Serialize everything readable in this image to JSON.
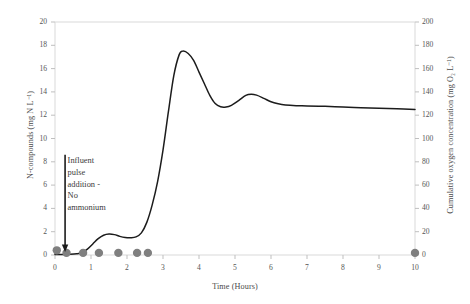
{
  "chart_data": {
    "type": "line",
    "title": "",
    "xlabel": "Time (Hours)",
    "ylabel": "N-compounds (mg N L⁻¹)",
    "ylabel_right": "Cumulative oxygen concentration (mg O₂ L⁻¹)",
    "xlim": [
      0,
      10
    ],
    "ylim": [
      0,
      20
    ],
    "ylim_right": [
      0,
      200
    ],
    "xticks": [
      0,
      1,
      2,
      3,
      4,
      5,
      6,
      7,
      8,
      9,
      10
    ],
    "yticks": [
      0,
      2,
      4,
      6,
      8,
      10,
      12,
      14,
      16,
      18,
      20
    ],
    "yticks_right": [
      0,
      20,
      40,
      60,
      80,
      100,
      120,
      140,
      160,
      180,
      200
    ],
    "grid": false,
    "legend": "none",
    "annotations": [
      {
        "text": "Influent\npulse\naddition -\nNo\nammonium",
        "x": 0.35,
        "y": 8.2,
        "arrow": "down-arrow",
        "arrow_x": 0.28,
        "arrow_from_y": 8.6,
        "arrow_to_y": 0.3
      }
    ],
    "series": [
      {
        "name": "Cumulative oxygen concentration",
        "type": "line",
        "color": "#1c1c1c",
        "axis": "right",
        "points": [
          [
            0.0,
            0.05
          ],
          [
            0.2,
            0.05
          ],
          [
            0.4,
            0.06
          ],
          [
            0.6,
            0.1
          ],
          [
            0.75,
            0.2
          ],
          [
            0.9,
            0.5
          ],
          [
            1.05,
            0.95
          ],
          [
            1.2,
            1.4
          ],
          [
            1.35,
            1.7
          ],
          [
            1.5,
            1.8
          ],
          [
            1.65,
            1.75
          ],
          [
            1.8,
            1.6
          ],
          [
            1.95,
            1.5
          ],
          [
            2.1,
            1.48
          ],
          [
            2.25,
            1.55
          ],
          [
            2.4,
            1.9
          ],
          [
            2.55,
            2.8
          ],
          [
            2.7,
            4.3
          ],
          [
            2.85,
            6.3
          ],
          [
            3.0,
            9.0
          ],
          [
            3.15,
            12.3
          ],
          [
            3.3,
            15.4
          ],
          [
            3.45,
            17.2
          ],
          [
            3.55,
            17.5
          ],
          [
            3.7,
            17.3
          ],
          [
            3.85,
            16.7
          ],
          [
            4.0,
            15.7
          ],
          [
            4.15,
            14.7
          ],
          [
            4.3,
            13.7
          ],
          [
            4.45,
            13.0
          ],
          [
            4.6,
            12.72
          ],
          [
            4.75,
            12.7
          ],
          [
            4.9,
            12.85
          ],
          [
            5.1,
            13.25
          ],
          [
            5.3,
            13.7
          ],
          [
            5.45,
            13.8
          ],
          [
            5.6,
            13.72
          ],
          [
            5.8,
            13.45
          ],
          [
            6.0,
            13.15
          ],
          [
            6.2,
            12.98
          ],
          [
            6.4,
            12.88
          ],
          [
            6.7,
            12.82
          ],
          [
            7.0,
            12.8
          ],
          [
            7.5,
            12.76
          ],
          [
            8.0,
            12.7
          ],
          [
            8.5,
            12.65
          ],
          [
            9.0,
            12.6
          ],
          [
            9.5,
            12.55
          ],
          [
            10.0,
            12.5
          ]
        ]
      },
      {
        "name": "N-compounds measurements",
        "type": "scatter",
        "color": "#7f7f7f",
        "axis": "left",
        "points": [
          [
            0.05,
            0.4
          ],
          [
            0.32,
            0.18
          ],
          [
            0.78,
            0.18
          ],
          [
            1.22,
            0.18
          ],
          [
            1.76,
            0.18
          ],
          [
            2.28,
            0.18
          ],
          [
            2.58,
            0.18
          ],
          [
            10.0,
            0.18
          ]
        ]
      }
    ]
  },
  "axes": {
    "frame_color": "#d9d9d9",
    "tick_color": "#bfbfbf"
  }
}
